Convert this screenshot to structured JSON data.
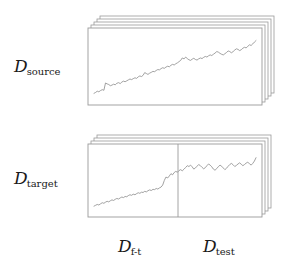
{
  "figure": {
    "width": 296,
    "height": 267,
    "background": "#ffffff",
    "line_color": "#8a8a8a",
    "box_stroke": "#9a9a9a",
    "text_color": "#1a1a1a"
  },
  "labels": {
    "source": {
      "symbol": "D",
      "subscript": "source"
    },
    "target": {
      "symbol": "D",
      "subscript": "target"
    },
    "finetune": {
      "symbol": "D",
      "subscript": "f-t"
    },
    "test": {
      "symbol": "D",
      "subscript": "test"
    }
  },
  "panels": {
    "source": {
      "name": "source-panel",
      "front_rect": {
        "x": 88,
        "y": 28,
        "width": 174,
        "height": 77
      },
      "stack_layers": 4,
      "layer_offset_x": 3,
      "layer_offset_y": 3,
      "divider": null
    },
    "target": {
      "name": "target-panel",
      "front_rect": {
        "x": 88,
        "y": 144,
        "width": 174,
        "height": 73
      },
      "stack_layers": 3,
      "layer_offset_x": 3,
      "layer_offset_y": 3,
      "divider": {
        "x": 178,
        "label_left": "f-t",
        "label_right": "test"
      }
    }
  },
  "chart_data": {
    "type": "line",
    "title": "",
    "xlabel": "",
    "ylabel": "",
    "grid": false,
    "legend": "none",
    "axis_ranges": {
      "x": [
        0,
        1
      ],
      "y": [
        0,
        1
      ]
    },
    "series": [
      {
        "name": "source-series",
        "panel": "source",
        "note": "Upward-trending noisy random walk spanning the full source panel width.",
        "n_points": 100,
        "x": [
          0.0,
          0.01,
          0.02,
          0.03,
          0.04,
          0.051,
          0.061,
          0.071,
          0.081,
          0.091,
          0.101,
          0.111,
          0.121,
          0.131,
          0.141,
          0.152,
          0.162,
          0.172,
          0.182,
          0.192,
          0.202,
          0.212,
          0.222,
          0.232,
          0.242,
          0.253,
          0.263,
          0.273,
          0.283,
          0.293,
          0.303,
          0.313,
          0.323,
          0.333,
          0.343,
          0.354,
          0.364,
          0.374,
          0.384,
          0.394,
          0.404,
          0.414,
          0.424,
          0.434,
          0.444,
          0.455,
          0.465,
          0.475,
          0.485,
          0.495,
          0.505,
          0.515,
          0.525,
          0.535,
          0.545,
          0.556,
          0.566,
          0.576,
          0.586,
          0.596,
          0.606,
          0.616,
          0.626,
          0.636,
          0.646,
          0.657,
          0.667,
          0.677,
          0.687,
          0.697,
          0.707,
          0.717,
          0.727,
          0.737,
          0.747,
          0.758,
          0.768,
          0.778,
          0.788,
          0.798,
          0.808,
          0.818,
          0.828,
          0.838,
          0.848,
          0.859,
          0.869,
          0.879,
          0.889,
          0.899,
          0.909,
          0.919,
          0.929,
          0.939,
          0.949,
          0.96,
          0.97,
          0.98,
          0.99,
          1.0
        ],
        "y": [
          0.06,
          0.075,
          0.095,
          0.085,
          0.105,
          0.12,
          0.11,
          0.23,
          0.215,
          0.205,
          0.185,
          0.195,
          0.21,
          0.2,
          0.225,
          0.235,
          0.22,
          0.245,
          0.26,
          0.25,
          0.265,
          0.28,
          0.295,
          0.285,
          0.3,
          0.315,
          0.305,
          0.33,
          0.345,
          0.335,
          0.355,
          0.4,
          0.385,
          0.37,
          0.39,
          0.405,
          0.42,
          0.415,
          0.435,
          0.45,
          0.445,
          0.465,
          0.48,
          0.47,
          0.49,
          0.505,
          0.495,
          0.52,
          0.535,
          0.525,
          0.545,
          0.56,
          0.58,
          0.6,
          0.64,
          0.625,
          0.655,
          0.63,
          0.61,
          0.6,
          0.62,
          0.635,
          0.615,
          0.605,
          0.625,
          0.64,
          0.63,
          0.65,
          0.665,
          0.655,
          0.675,
          0.69,
          0.68,
          0.7,
          0.72,
          0.745,
          0.735,
          0.715,
          0.7,
          0.69,
          0.71,
          0.73,
          0.755,
          0.745,
          0.725,
          0.745,
          0.77,
          0.79,
          0.78,
          0.76,
          0.775,
          0.8,
          0.815,
          0.805,
          0.83,
          0.855,
          0.845,
          0.87,
          0.9,
          0.925
        ]
      },
      {
        "name": "target-series",
        "panel": "target",
        "note": "Noisy random walk with a sharp step-up near the fine-tune/test boundary, then a choppy plateau.",
        "n_points": 100,
        "x": [
          0.0,
          0.01,
          0.02,
          0.03,
          0.04,
          0.051,
          0.061,
          0.071,
          0.081,
          0.091,
          0.101,
          0.111,
          0.121,
          0.131,
          0.141,
          0.152,
          0.162,
          0.172,
          0.182,
          0.192,
          0.202,
          0.212,
          0.222,
          0.232,
          0.242,
          0.253,
          0.263,
          0.273,
          0.283,
          0.293,
          0.303,
          0.313,
          0.323,
          0.333,
          0.343,
          0.354,
          0.364,
          0.374,
          0.384,
          0.394,
          0.404,
          0.414,
          0.424,
          0.434,
          0.444,
          0.455,
          0.465,
          0.475,
          0.485,
          0.495,
          0.505,
          0.515,
          0.525,
          0.535,
          0.545,
          0.556,
          0.566,
          0.576,
          0.586,
          0.596,
          0.606,
          0.616,
          0.626,
          0.636,
          0.646,
          0.657,
          0.667,
          0.677,
          0.687,
          0.697,
          0.707,
          0.717,
          0.727,
          0.737,
          0.747,
          0.758,
          0.768,
          0.778,
          0.788,
          0.798,
          0.808,
          0.818,
          0.828,
          0.838,
          0.848,
          0.859,
          0.869,
          0.879,
          0.889,
          0.899,
          0.909,
          0.919,
          0.929,
          0.939,
          0.949,
          0.96,
          0.97,
          0.98,
          0.99,
          1.0
        ],
        "y": [
          0.05,
          0.065,
          0.08,
          0.07,
          0.09,
          0.11,
          0.1,
          0.12,
          0.135,
          0.125,
          0.145,
          0.16,
          0.15,
          0.17,
          0.185,
          0.175,
          0.195,
          0.21,
          0.2,
          0.22,
          0.215,
          0.235,
          0.25,
          0.24,
          0.26,
          0.25,
          0.27,
          0.285,
          0.275,
          0.295,
          0.29,
          0.31,
          0.3,
          0.32,
          0.335,
          0.325,
          0.345,
          0.34,
          0.36,
          0.35,
          0.37,
          0.385,
          0.42,
          0.5,
          0.56,
          0.545,
          0.58,
          0.62,
          0.6,
          0.64,
          0.66,
          0.645,
          0.675,
          0.69,
          0.67,
          0.7,
          0.73,
          0.76,
          0.745,
          0.77,
          0.74,
          0.7,
          0.72,
          0.75,
          0.78,
          0.76,
          0.73,
          0.705,
          0.725,
          0.76,
          0.79,
          0.77,
          0.74,
          0.7,
          0.68,
          0.71,
          0.745,
          0.77,
          0.75,
          0.72,
          0.69,
          0.715,
          0.75,
          0.78,
          0.8,
          0.775,
          0.745,
          0.765,
          0.79,
          0.81,
          0.785,
          0.76,
          0.78,
          0.805,
          0.82,
          0.795,
          0.77,
          0.8,
          0.84,
          0.9
        ]
      }
    ]
  }
}
